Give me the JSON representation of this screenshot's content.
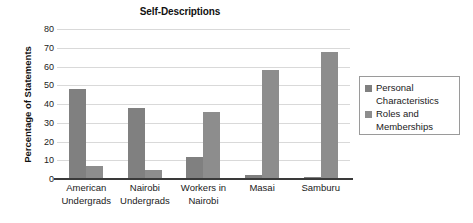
{
  "chart_data": {
    "type": "bar",
    "title": "Self-Descriptions",
    "xlabel": "",
    "ylabel": "Percentage of Statements",
    "ylim": [
      0,
      80
    ],
    "ytick_step": 10,
    "yticks": [
      80,
      70,
      60,
      50,
      40,
      30,
      20,
      10,
      0
    ],
    "grid": true,
    "legend_position": "right",
    "categories": [
      "American Undergrads",
      "Nairobi Undergrads",
      "Workers in Nairobi",
      "Masai",
      "Samburu"
    ],
    "category_lines": [
      [
        "American",
        "Undergrads"
      ],
      [
        "Nairobi",
        "Undergrads"
      ],
      [
        "Workers in",
        "Nairobi"
      ],
      [
        "Masai"
      ],
      [
        "Samburu"
      ]
    ],
    "series": [
      {
        "name": "Personal Characteristics",
        "name_lines": [
          "Personal",
          "Characteristics"
        ],
        "color": "#808080",
        "values": [
          48,
          38,
          12,
          2,
          1
        ]
      },
      {
        "name": "Roles and Memberships",
        "name_lines": [
          "Roles and",
          "Memberships"
        ],
        "color": "#8d8d8d",
        "values": [
          7,
          5,
          36,
          58,
          68
        ]
      }
    ]
  }
}
